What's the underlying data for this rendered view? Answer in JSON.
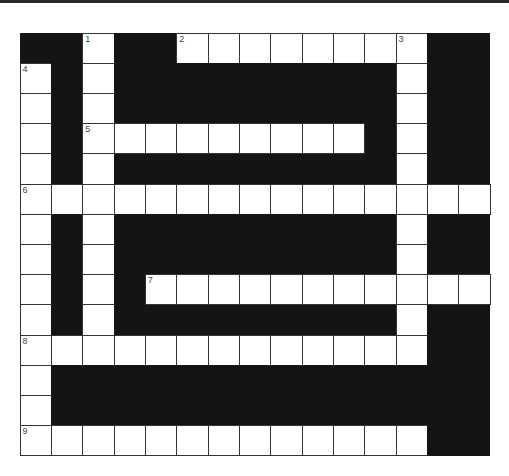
{
  "puzzle": {
    "rows": 14,
    "cols": 15,
    "colors": {
      "black": "#141414",
      "white": "#ffffff",
      "border": "#333333"
    },
    "pattern": [
      "##X##XXXXXXXX##",
      "X#X#########X##",
      "X#X#########X##",
      "X#XXXXXXXXX#X##",
      "X#X#########X##",
      "XXXXXXXXXXXXXXX",
      "X#X#########X##",
      "X#X#########X##",
      "X#X#XXXXXXXXXXX",
      "X#X#########X##",
      "XXXXXXXXXXXXX##",
      "X##############",
      "X##############",
      "XXXXXXXXXXXXX##"
    ],
    "numbers": [
      {
        "n": "1",
        "r": 0,
        "c": 2
      },
      {
        "n": "2",
        "r": 0,
        "c": 5
      },
      {
        "n": "3",
        "r": 0,
        "c": 12
      },
      {
        "n": "4",
        "r": 1,
        "c": 0
      },
      {
        "n": "5",
        "r": 3,
        "c": 2
      },
      {
        "n": "6",
        "r": 5,
        "c": 0
      },
      {
        "n": "7",
        "r": 8,
        "c": 4
      },
      {
        "n": "8",
        "r": 10,
        "c": 0
      },
      {
        "n": "9",
        "r": 13,
        "c": 0
      }
    ]
  }
}
